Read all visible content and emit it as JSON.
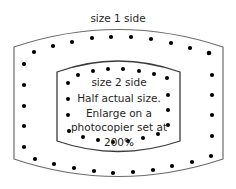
{
  "diagram": {
    "type": "sewing-template",
    "colors": {
      "outline": "#6b6b6b",
      "inner_outline": "#3a3a3a",
      "stitch_dot": "#000000",
      "text": "#1f1f1f",
      "background": "#ffffff"
    },
    "outer_shape": {
      "label": "size 1 side"
    },
    "inner_shape": {
      "label": "size 2 side",
      "note_lines": [
        "Half actual size.",
        "Enlarge on a",
        "photocopier set at",
        "200%"
      ]
    }
  }
}
